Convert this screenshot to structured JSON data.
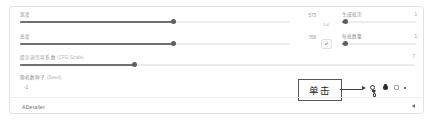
{
  "panel": {
    "sliders": [
      {
        "name": "width",
        "label": "宽度",
        "value": "575",
        "fill_pct": 57,
        "unit_chip": ""
      },
      {
        "name": "height",
        "label": "高度",
        "value": "768",
        "fill_pct": 57,
        "unit_chip": ""
      },
      {
        "name": "cfg-scale",
        "label": "提示词引导系数",
        "label_dim": "(CFG Scale)",
        "value": "7",
        "fill_pct": 29,
        "unit_chip": ""
      }
    ],
    "mid_chips": [
      {
        "name": "swap-ratio-value",
        "text": "1:4"
      },
      {
        "name": "swap-dimensions-button",
        "text": "⇄"
      }
    ],
    "number_fields": [
      {
        "name": "batch-count",
        "label": "生成批次",
        "value": "1",
        "fill_pct": 4
      },
      {
        "name": "batch-size",
        "label": "每批数量",
        "value": "1",
        "fill_pct": 4
      }
    ],
    "seed": {
      "label": "随机数种子",
      "label_dim": "(Seed)",
      "value": "-1"
    },
    "accordion": {
      "title": "ADetailer",
      "caret": "collapse-caret"
    },
    "annotation": {
      "text": "单击",
      "arrow": "arrow-right"
    },
    "icon_strip": [
      {
        "name": "recycle-seed-icon"
      },
      {
        "name": "dice-seed-icon"
      },
      {
        "name": "extra-seed-checkbox"
      },
      {
        "name": "seed-dot-icon"
      }
    ],
    "colors": {
      "track": "#ececef",
      "fill": "#6f6f78",
      "knob": "#5c5c66",
      "label": "#8e8e96",
      "border": "#e3e3e6",
      "annotation": "#3d3d44"
    }
  }
}
